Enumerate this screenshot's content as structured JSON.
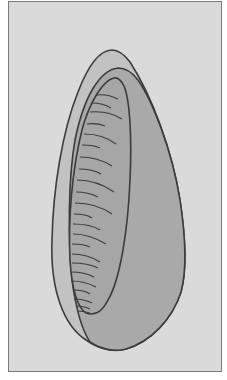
{
  "figure": {
    "colors": {
      "background": "#dadada",
      "frame_border": "#7a7a7a",
      "outer_fill": "#c2c2c2",
      "inner_fill": "#a9a9a9",
      "core_fill": "#a6a6a6",
      "stroke": "#3c3c3c"
    },
    "striations_count": 23
  }
}
